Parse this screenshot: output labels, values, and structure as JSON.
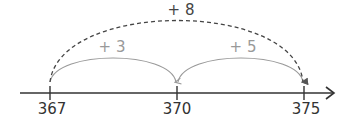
{
  "diagram": {
    "type": "number-line-jumps",
    "colors": {
      "axis": "#333333",
      "small_jumps": "#9a9a9a",
      "total_jump": "#444444"
    },
    "ticks": [
      {
        "value": "367",
        "x": 50
      },
      {
        "value": "370",
        "x": 177
      },
      {
        "value": "375",
        "x": 304
      }
    ],
    "jumps": [
      {
        "label": "+ 3",
        "from": "367",
        "to": "370",
        "style": "solid"
      },
      {
        "label": "+ 5",
        "from": "370",
        "to": "375",
        "style": "solid"
      }
    ],
    "total_jump": {
      "label": "+ 8",
      "from": "367",
      "to": "375",
      "style": "dashed"
    }
  }
}
